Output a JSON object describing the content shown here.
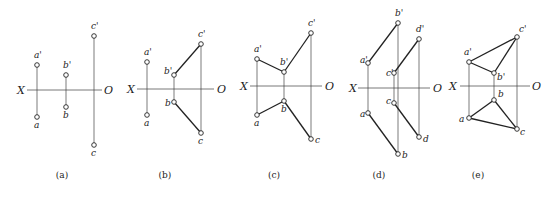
{
  "figure": {
    "panels": [
      {
        "id": "a",
        "caption": "(a)",
        "caption_pos": [
          62,
          178
        ],
        "axis": {
          "y": 90,
          "x1": 27,
          "x2": 102,
          "x_label": "X",
          "x_label_pos": [
            17,
            94
          ],
          "o_label": "O",
          "o_label_pos": [
            104,
            94
          ]
        },
        "points": [
          {
            "name": "a'",
            "x": 37,
            "y": 65,
            "lx": 34,
            "ly": 58
          },
          {
            "name": "a",
            "x": 37,
            "y": 117,
            "lx": 34,
            "ly": 128
          },
          {
            "name": "b'",
            "x": 66,
            "y": 75,
            "lx": 63,
            "ly": 68
          },
          {
            "name": "b",
            "x": 66,
            "y": 107,
            "lx": 63,
            "ly": 118
          },
          {
            "name": "c'",
            "x": 94,
            "y": 36,
            "lx": 91,
            "ly": 29
          },
          {
            "name": "c",
            "x": 94,
            "y": 145,
            "lx": 91,
            "ly": 156
          }
        ],
        "projectors": [
          [
            "a'",
            "a"
          ],
          [
            "b'",
            "b"
          ],
          [
            "c'",
            "c"
          ]
        ],
        "edges": []
      },
      {
        "id": "b",
        "caption": "(b)",
        "caption_pos": [
          165,
          178
        ],
        "axis": {
          "y": 89,
          "x1": 137,
          "x2": 214,
          "x_label": "X",
          "x_label_pos": [
            127,
            93
          ],
          "o_label": "O",
          "o_label_pos": [
            217,
            93
          ]
        },
        "points": [
          {
            "name": "a'",
            "x": 147,
            "y": 62,
            "lx": 144,
            "ly": 55
          },
          {
            "name": "a",
            "x": 147,
            "y": 115,
            "lx": 144,
            "ly": 126
          },
          {
            "name": "b'",
            "x": 174,
            "y": 75,
            "lx": 164,
            "ly": 74
          },
          {
            "name": "b",
            "x": 174,
            "y": 102,
            "lx": 165,
            "ly": 106
          },
          {
            "name": "c'",
            "x": 201,
            "y": 44,
            "lx": 198,
            "ly": 37
          },
          {
            "name": "c",
            "x": 201,
            "y": 133,
            "lx": 198,
            "ly": 144
          }
        ],
        "projectors": [
          [
            "a'",
            "a"
          ],
          [
            "b'",
            "b"
          ],
          [
            "c'",
            "c"
          ]
        ],
        "edges": [
          [
            "b'",
            "c'"
          ],
          [
            "b",
            "c"
          ]
        ]
      },
      {
        "id": "c",
        "caption": "(c)",
        "caption_pos": [
          274,
          178
        ],
        "axis": {
          "y": 86,
          "x1": 250,
          "x2": 322,
          "x_label": "X",
          "x_label_pos": [
            240,
            90
          ],
          "o_label": "O",
          "o_label_pos": [
            325,
            90
          ]
        },
        "points": [
          {
            "name": "a'",
            "x": 257,
            "y": 59,
            "lx": 254,
            "ly": 52
          },
          {
            "name": "a",
            "x": 257,
            "y": 115,
            "lx": 254,
            "ly": 126
          },
          {
            "name": "b'",
            "x": 284,
            "y": 72,
            "lx": 280,
            "ly": 65
          },
          {
            "name": "b",
            "x": 284,
            "y": 101,
            "lx": 281,
            "ly": 112
          },
          {
            "name": "c'",
            "x": 311,
            "y": 33,
            "lx": 308,
            "ly": 26
          },
          {
            "name": "c",
            "x": 311,
            "y": 139,
            "lx": 315,
            "ly": 143
          }
        ],
        "projectors": [
          [
            "a'",
            "a"
          ],
          [
            "b'",
            "b"
          ],
          [
            "c'",
            "c"
          ]
        ],
        "edges": [
          [
            "a'",
            "b'"
          ],
          [
            "b'",
            "c'"
          ],
          [
            "a",
            "b"
          ],
          [
            "b",
            "c"
          ]
        ]
      },
      {
        "id": "d",
        "caption": "(d)",
        "caption_pos": [
          379,
          178
        ],
        "axis": {
          "y": 88,
          "x1": 358,
          "x2": 430,
          "x_label": "X",
          "x_label_pos": [
            349,
            92
          ],
          "o_label": "O",
          "o_label_pos": [
            433,
            92
          ]
        },
        "points": [
          {
            "name": "a'",
            "x": 368,
            "y": 63,
            "lx": 360,
            "ly": 63
          },
          {
            "name": "a",
            "x": 368,
            "y": 113,
            "lx": 360,
            "ly": 117
          },
          {
            "name": "b'",
            "x": 398,
            "y": 23,
            "lx": 395,
            "ly": 16
          },
          {
            "name": "b",
            "x": 398,
            "y": 154,
            "lx": 402,
            "ly": 158
          },
          {
            "name": "c'",
            "x": 394,
            "y": 73,
            "lx": 386,
            "ly": 76
          },
          {
            "name": "c",
            "x": 394,
            "y": 103,
            "lx": 386,
            "ly": 104
          },
          {
            "name": "d'",
            "x": 419,
            "y": 39,
            "lx": 416,
            "ly": 32
          },
          {
            "name": "d",
            "x": 419,
            "y": 137,
            "lx": 423,
            "ly": 142
          }
        ],
        "projectors": [
          [
            "a'",
            "a"
          ],
          [
            "b'",
            "b"
          ],
          [
            "c'",
            "c"
          ],
          [
            "d'",
            "d"
          ]
        ],
        "edges": [
          [
            "a'",
            "b'"
          ],
          [
            "c'",
            "d'"
          ],
          [
            "a",
            "b"
          ],
          [
            "c",
            "d"
          ]
        ]
      },
      {
        "id": "e",
        "caption": "(e)",
        "caption_pos": [
          478,
          178
        ],
        "axis": {
          "y": 86,
          "x1": 460,
          "x2": 530,
          "x_label": "X",
          "x_label_pos": [
            449,
            90
          ],
          "o_label": "O",
          "o_label_pos": [
            532,
            90
          ]
        },
        "points": [
          {
            "name": "a'",
            "x": 469,
            "y": 62,
            "lx": 464,
            "ly": 55
          },
          {
            "name": "a",
            "x": 469,
            "y": 118,
            "lx": 459,
            "ly": 122
          },
          {
            "name": "b'",
            "x": 494,
            "y": 73,
            "lx": 497,
            "ly": 80
          },
          {
            "name": "b",
            "x": 494,
            "y": 100,
            "lx": 498,
            "ly": 97
          },
          {
            "name": "c'",
            "x": 517,
            "y": 37,
            "lx": 519,
            "ly": 32
          },
          {
            "name": "c",
            "x": 517,
            "y": 129,
            "lx": 520,
            "ly": 135
          }
        ],
        "projectors": [
          [
            "a'",
            "a"
          ],
          [
            "b'",
            "b"
          ],
          [
            "c'",
            "c"
          ]
        ],
        "edges": [
          [
            "a'",
            "b'"
          ],
          [
            "b'",
            "c'"
          ],
          [
            "a'",
            "c'"
          ],
          [
            "a",
            "b"
          ],
          [
            "b",
            "c"
          ],
          [
            "a",
            "c"
          ]
        ]
      }
    ]
  }
}
